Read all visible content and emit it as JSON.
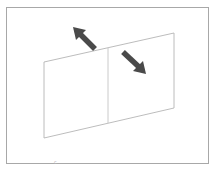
{
  "figure": {
    "colors": {
      "background": "#ffffff",
      "frame_stroke": "#a8a8a8",
      "panel_stroke": "#b4b4b4",
      "divider_stroke": "#c4c4c4",
      "arrow_fill": "#4a4a4a"
    },
    "frame": {
      "x": 6,
      "y": 7,
      "width": 203,
      "height": 157
    },
    "panel": {
      "top_left": [
        44,
        62
      ],
      "top_right": [
        174,
        33
      ],
      "bottom_right": [
        174,
        108
      ],
      "bottom_left": [
        44,
        138
      ],
      "divider_top": [
        108,
        48
      ],
      "divider_bottom": [
        108,
        123
      ]
    },
    "arrows": [
      {
        "name": "arrow-up-left",
        "direction": "up-left",
        "tail": [
          95,
          49
        ],
        "head": [
          73,
          27
        ]
      },
      {
        "name": "arrow-down-right",
        "direction": "down-right",
        "tail": [
          123,
          52
        ],
        "head": [
          146,
          74
        ]
      }
    ],
    "stray_mark": "c"
  }
}
